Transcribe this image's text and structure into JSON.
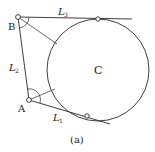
{
  "figure": {
    "caption": "(a)",
    "circle_label": "C",
    "points": {
      "B": {
        "label": "B"
      },
      "A": {
        "label": "A"
      }
    },
    "lines": {
      "L1": {
        "label": "L",
        "sub": "1"
      },
      "L2": {
        "label": "L",
        "sub": "2"
      },
      "L3": {
        "label": "L",
        "sub": "3"
      }
    },
    "colors": {
      "stroke": "#2a2a2a",
      "background": "#ffffff"
    }
  }
}
